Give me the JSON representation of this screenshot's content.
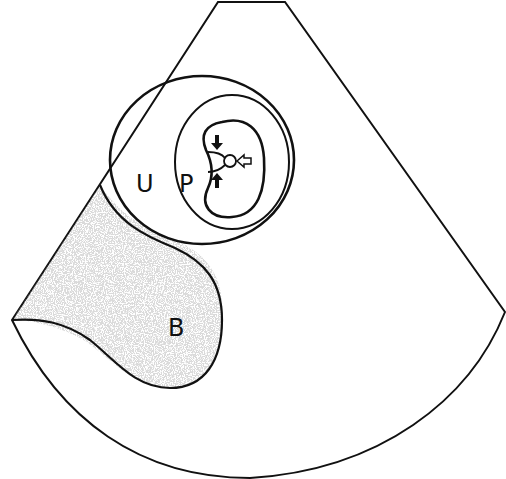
{
  "figure": {
    "type": "ultrasound-sector-schematic",
    "labels": {
      "urethra": "U",
      "prostate": "P",
      "bladder": "B"
    },
    "arrows": [
      {
        "name": "arrow-down",
        "style": "solid"
      },
      {
        "name": "arrow-up",
        "style": "solid"
      },
      {
        "name": "arrow-left",
        "style": "hollow"
      }
    ],
    "colors": {
      "line": "#111111",
      "background": "#ffffff",
      "speckle": "#555555"
    }
  }
}
